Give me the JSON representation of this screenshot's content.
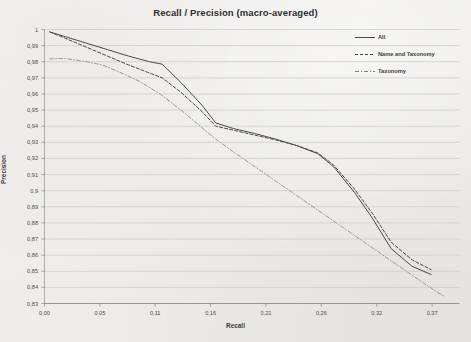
{
  "chart_data": {
    "type": "line",
    "title": "Recall / Precision (macro-averaged)",
    "xlabel": "Recall",
    "ylabel": "Precision",
    "xlim": [
      0.0,
      0.395
    ],
    "ylim": [
      0.83,
      1.0
    ],
    "grid": true,
    "grid_axis": "y",
    "legend_position": "top-right",
    "xticks": [
      0.0,
      0.0527,
      0.1054,
      0.1581,
      0.2108,
      0.2635,
      0.3162,
      0.3689
    ],
    "xticklabels": [
      "0,00",
      "0,05",
      "0,11",
      "0,16",
      "0,21",
      "0,26",
      "0,32",
      "0,37"
    ],
    "yticks": [
      1.0,
      0.99,
      0.98,
      0.97,
      0.96,
      0.95,
      0.94,
      0.93,
      0.92,
      0.91,
      0.9,
      0.89,
      0.88,
      0.87,
      0.86,
      0.85,
      0.84,
      0.83
    ],
    "yticklabels": [
      "1",
      "0,99",
      "0,98",
      "0,97",
      "0,96",
      "0,95",
      "0,94",
      "0,93",
      "0,92",
      "0,91",
      "0,9",
      "0,89",
      "0,88",
      "0,87",
      "0,86",
      "0,85",
      "0,84",
      "0,83"
    ],
    "series": [
      {
        "name": "All",
        "style": "solid",
        "color": "#4a4a4a",
        "x": [
          0.005,
          0.02,
          0.04,
          0.06,
          0.08,
          0.1,
          0.112,
          0.13,
          0.15,
          0.163,
          0.18,
          0.2,
          0.22,
          0.24,
          0.26,
          0.275,
          0.295,
          0.312,
          0.33,
          0.35,
          0.368
        ],
        "y": [
          0.9985,
          0.9955,
          0.9915,
          0.9875,
          0.9835,
          0.98,
          0.9785,
          0.967,
          0.953,
          0.942,
          0.9385,
          0.9355,
          0.932,
          0.928,
          0.923,
          0.915,
          0.899,
          0.883,
          0.864,
          0.853,
          0.848
        ]
      },
      {
        "name": "Name and Taxonomy",
        "style": "dashed",
        "color": "#4a4a4a",
        "x": [
          0.005,
          0.02,
          0.04,
          0.06,
          0.08,
          0.1,
          0.112,
          0.13,
          0.15,
          0.163,
          0.18,
          0.2,
          0.22,
          0.24,
          0.26,
          0.275,
          0.295,
          0.312,
          0.33,
          0.35,
          0.368
        ],
        "y": [
          0.9985,
          0.9945,
          0.989,
          0.9835,
          0.978,
          0.973,
          0.97,
          0.961,
          0.949,
          0.94,
          0.9375,
          0.9345,
          0.9315,
          0.928,
          0.9235,
          0.916,
          0.901,
          0.886,
          0.868,
          0.857,
          0.851
        ]
      },
      {
        "name": "Taxonomy",
        "style": "dashdot",
        "color": "#8a8a8a",
        "x": [
          0.005,
          0.02,
          0.04,
          0.055,
          0.07,
          0.09,
          0.11,
          0.13,
          0.15,
          0.163,
          0.18,
          0.2,
          0.22,
          0.24,
          0.26,
          0.28,
          0.3,
          0.32,
          0.34,
          0.36,
          0.38
        ],
        "y": [
          0.9818,
          0.982,
          0.98,
          0.978,
          0.974,
          0.968,
          0.96,
          0.95,
          0.939,
          0.932,
          0.924,
          0.915,
          0.906,
          0.897,
          0.888,
          0.879,
          0.87,
          0.861,
          0.852,
          0.843,
          0.8345
        ]
      }
    ]
  },
  "legend": {
    "entries": [
      {
        "label": "All"
      },
      {
        "label": "Name and Taxonomy"
      },
      {
        "label": "Taxonomy"
      }
    ]
  }
}
